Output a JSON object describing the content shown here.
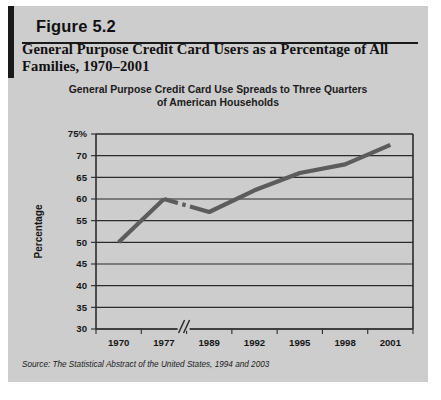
{
  "figure": {
    "number_label": "Figure 5.2",
    "title": "General Purpose Credit Card Users as a Percentage of All Families, 1970–2001",
    "subtitle_line1": "General Purpose Credit Card Use Spreads to Three Quarters",
    "subtitle_line2": "of American Households",
    "source": "Source: The Statistical Abstract of the United States, 1994 and 2003",
    "background_color": "#cdcdcd",
    "accent_bar_color": "#1a1a1a",
    "line_color": "#5c5c5c",
    "grid_color": "#2b2b2b"
  },
  "chart_data": {
    "type": "line",
    "title": "General Purpose Credit Card Use Spreads to Three Quarters of American Households",
    "xlabel": "Year",
    "ylabel": "Percentage",
    "categories": [
      "1970",
      "1977",
      "1989",
      "1992",
      "1995",
      "1998",
      "2001"
    ],
    "values": [
      50,
      60,
      57,
      62,
      66,
      68,
      72.5
    ],
    "ylim": [
      30,
      75
    ],
    "ytick_labels": [
      "75%",
      "70",
      "65",
      "60",
      "55",
      "50",
      "45",
      "40",
      "35",
      "30"
    ],
    "ytick_values": [
      75,
      70,
      65,
      60,
      55,
      50,
      45,
      40,
      35,
      30
    ],
    "grid": true,
    "legend": "none",
    "axis_break": {
      "symbol": "//",
      "between": [
        "1977",
        "1989"
      ]
    }
  }
}
